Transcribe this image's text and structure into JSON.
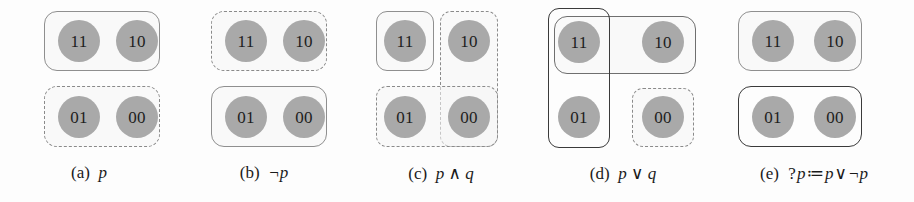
{
  "figure": {
    "background": "#fdfdfd",
    "disc_color": "#a9a9a9",
    "solid_border_color": "#8f8f8f",
    "dark_border_color": "#3b3b3b",
    "dashed_border_color": "#8a8a8a",
    "states": {
      "s11": "11",
      "s10": "10",
      "s01": "01",
      "s00": "00"
    }
  },
  "panels": [
    {
      "id": "a",
      "tag": "(a)",
      "expr": "p",
      "caption_full": "(a) p",
      "cells": [
        "11",
        "10",
        "01",
        "00"
      ],
      "regions": [
        {
          "name": "top-row-solid",
          "style": "solid",
          "covers": [
            "11",
            "10"
          ]
        },
        {
          "name": "bottom-row-dashed",
          "style": "dashed",
          "covers": [
            "01",
            "00"
          ]
        }
      ]
    },
    {
      "id": "b",
      "tag": "(b)",
      "expr": "¬p",
      "caption_full": "(b) ¬p",
      "cells": [
        "11",
        "10",
        "01",
        "00"
      ],
      "regions": [
        {
          "name": "top-row-dashed",
          "style": "dashed",
          "covers": [
            "11",
            "10"
          ]
        },
        {
          "name": "bottom-row-solid",
          "style": "solid",
          "covers": [
            "01",
            "00"
          ]
        }
      ]
    },
    {
      "id": "c",
      "tag": "(c)",
      "expr": "p ∧ q",
      "caption_full": "(c) p ∧ q",
      "cells": [
        "11",
        "10",
        "01",
        "00"
      ],
      "regions": [
        {
          "name": "single-11-solid",
          "style": "solid",
          "covers": [
            "11"
          ]
        },
        {
          "name": "right-column-dashed",
          "style": "dashed",
          "covers": [
            "10",
            "00"
          ]
        },
        {
          "name": "bottom-row-dashed",
          "style": "dashed",
          "covers": [
            "01",
            "00"
          ]
        }
      ]
    },
    {
      "id": "d",
      "tag": "(d)",
      "expr": "p ∨ q",
      "caption_full": "(d) p ∨ q",
      "cells": [
        "11",
        "10",
        "01",
        "00"
      ],
      "regions": [
        {
          "name": "left-column-solid",
          "style": "solid-dark",
          "covers": [
            "11",
            "01"
          ]
        },
        {
          "name": "top-row-solid",
          "style": "solid-mid",
          "covers": [
            "11",
            "10"
          ]
        },
        {
          "name": "single-00-dashed",
          "style": "dashed",
          "covers": [
            "00"
          ]
        }
      ]
    },
    {
      "id": "e",
      "tag": "(e)",
      "expr": "?p ≔ p ∨ ¬p",
      "caption_parts": {
        "lead": "?",
        "p1": "p",
        "define": "≔",
        "p2": "p",
        "or": "∨",
        "neg": "¬",
        "p3": "p"
      },
      "caption_full": "(e) ?p≔p∨¬p",
      "cells": [
        "11",
        "10",
        "01",
        "00"
      ],
      "regions": [
        {
          "name": "top-row-solid",
          "style": "solid",
          "covers": [
            "11",
            "10"
          ]
        },
        {
          "name": "bottom-row-solid",
          "style": "solid-dark",
          "covers": [
            "01",
            "00"
          ]
        }
      ]
    }
  ]
}
